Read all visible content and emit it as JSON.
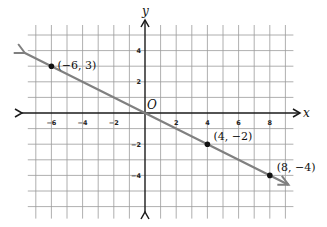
{
  "chart_data": {
    "type": "line",
    "title": "",
    "xlabel": "x",
    "ylabel": "y",
    "origin_label": "O",
    "xlim": [
      -7,
      9
    ],
    "ylim": [
      -6,
      5
    ],
    "grid": true,
    "x_ticks": [
      -6,
      -4,
      -2,
      2,
      4,
      6,
      8
    ],
    "y_ticks": [
      4,
      2,
      -2,
      -4
    ],
    "x_tick_labels": [
      "−6",
      "−4",
      "−2",
      "2",
      "4",
      "6",
      "8"
    ],
    "y_tick_labels": [
      "4",
      "2",
      "−2",
      "−4"
    ],
    "series": [
      {
        "name": "line y = -x/2",
        "equation": "y = -0.5x",
        "color": "#808080",
        "arrows_both_ends": true,
        "x": [
          -7.7,
          9.2
        ],
        "y": [
          3.85,
          -4.6
        ]
      }
    ],
    "points": [
      {
        "x": -6,
        "y": 3,
        "label": "(−6, 3)"
      },
      {
        "x": 4,
        "y": -2,
        "label": "(4, −2)"
      },
      {
        "x": 8,
        "y": -4,
        "label": "(8, −4)"
      }
    ]
  },
  "colors": {
    "grid": "#9a9a9a",
    "axis": "#1a1a1a",
    "line": "#808080",
    "point": "#111111",
    "background": "#ffffff"
  }
}
